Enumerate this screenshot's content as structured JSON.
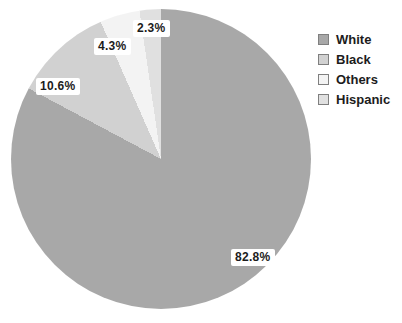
{
  "chart_data": {
    "type": "pie",
    "title": "",
    "categories": [
      "White",
      "Black",
      "Others",
      "Hispanic"
    ],
    "values": [
      82.8,
      10.6,
      4.3,
      2.3
    ],
    "slice_labels": [
      "82.8%",
      "10.6%",
      "4.3%",
      "2.3%"
    ],
    "colors": [
      "#a8a8a8",
      "#d1d1d1",
      "#f3f3f3",
      "#e0e0e0"
    ],
    "start_angle_deg": 0,
    "direction": "clockwise",
    "legend_position": "right",
    "grid": false
  },
  "legend": {
    "items": [
      {
        "label": "White"
      },
      {
        "label": "Black"
      },
      {
        "label": "Others"
      },
      {
        "label": "Hispanic"
      }
    ]
  }
}
